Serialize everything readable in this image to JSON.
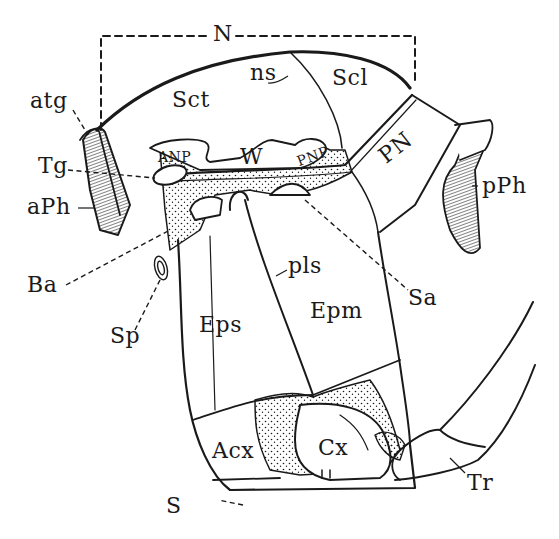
{
  "figure": {
    "labels": {
      "N": "N",
      "ns": "ns",
      "Sct": "Sct",
      "Scl": "Scl",
      "atg": "atg",
      "Tg": "Tg",
      "aPh": "aPh",
      "pPh": "pPh",
      "ANP": "ANP",
      "W": "W",
      "PNP": "PNP",
      "PN": "PN",
      "Ba": "Ba",
      "Sp": "Sp",
      "pls": "pls",
      "Sa": "Sa",
      "Eps": "Eps",
      "Epm": "Epm",
      "Acx": "Acx",
      "Cx": "Cx",
      "S": "S",
      "Tr": "Tr"
    },
    "colors": {
      "ink": "#1a1a1a",
      "background": "#ffffff"
    }
  }
}
